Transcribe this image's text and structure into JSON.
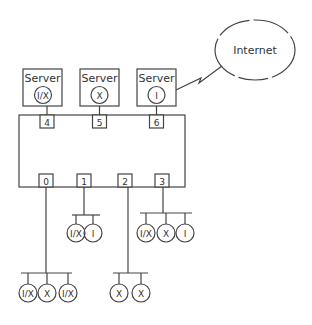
{
  "diagram": {
    "internet": {
      "label": "Internet"
    },
    "servers": [
      {
        "label": "Server",
        "node": "I/X"
      },
      {
        "label": "Server",
        "node": "X"
      },
      {
        "label": "Server",
        "node": "I"
      }
    ],
    "switch": {
      "top_ports": [
        "4",
        "5",
        "6"
      ],
      "bottom_ports": [
        "0",
        "1",
        "2",
        "3"
      ]
    },
    "groups": {
      "port0": [
        "I/X",
        "X",
        "I/X"
      ],
      "port1": [
        "I/X",
        "I"
      ],
      "port2": [
        "X",
        "X"
      ],
      "port3": [
        "I/X",
        "X",
        "I"
      ]
    }
  }
}
